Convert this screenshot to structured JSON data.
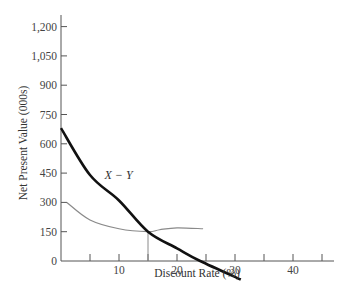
{
  "chart_data": {
    "type": "line",
    "title": "",
    "xlabel": "Discount Rate (%)",
    "ylabel": "Net Present Value (000s)",
    "xlim": [
      0,
      47
    ],
    "ylim": [
      0,
      1250
    ],
    "grid": false,
    "legend": "none",
    "x_ticks": [
      5,
      10,
      15,
      20,
      25,
      30,
      35,
      40,
      45
    ],
    "x_tick_labels": [
      {
        "value": 10,
        "label": "10"
      },
      {
        "value": 20,
        "label": "20"
      },
      {
        "value": 30,
        "label": "30"
      },
      {
        "value": 40,
        "label": "40"
      }
    ],
    "y_ticks": [
      0,
      150,
      300,
      450,
      600,
      750,
      900,
      1050,
      1200
    ],
    "y_tick_labels": [
      "0",
      "150",
      "300",
      "450",
      "600",
      "750",
      "900",
      "1,050",
      "1,200"
    ],
    "series": [
      {
        "name": "X − Y",
        "style": "thick black",
        "color": "#111111",
        "x": [
          0,
          5,
          10,
          15,
          20,
          24,
          31
        ],
        "values": [
          680,
          440,
          310,
          150,
          65,
          0,
          -95
        ]
      },
      {
        "name": "unlabeled",
        "style": "thin gray",
        "color": "#8a8a8a",
        "x": [
          1,
          5,
          10,
          15,
          17,
          20,
          24.5
        ],
        "values": [
          300,
          210,
          165,
          150,
          160,
          170,
          165
        ]
      }
    ],
    "annotations": [
      {
        "text": "X − Y",
        "x": 7.5,
        "y": 440
      },
      {
        "type": "vertical-drop-line",
        "x": 15,
        "from_y": 150,
        "to_y": 0
      }
    ]
  }
}
